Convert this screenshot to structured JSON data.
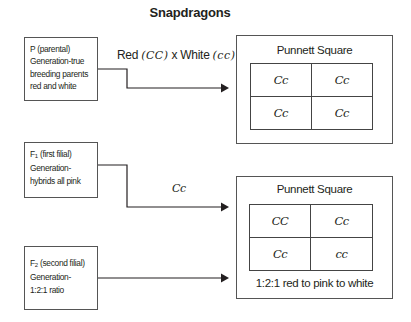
{
  "title": "Snapdragons",
  "generations": {
    "p": {
      "lines": [
        "P (parental)",
        "Generation-true",
        "breeding parents",
        "red and white"
      ]
    },
    "f1": {
      "prefix": "F",
      "subscript": "1",
      "line1_rest": " (first filial)",
      "lines": [
        "Generation-",
        "hybrids all pink"
      ]
    },
    "f2": {
      "prefix": "F",
      "subscript": "2",
      "line1_rest": " (second filial)",
      "lines": [
        "Generation-",
        "1:2:1 ratio"
      ]
    }
  },
  "cross": {
    "red_label": "Red ",
    "red_genotype": "(CC)",
    "times": " x White ",
    "white_genotype": "(cc)"
  },
  "f1_genotype": "Cc",
  "punnett1": {
    "title": "Punnett Square",
    "cells": [
      "Cc",
      "Cc",
      "Cc",
      "Cc"
    ]
  },
  "punnett2": {
    "title": "Punnett Square",
    "cells": [
      "CC",
      "Cc",
      "Cc",
      "cc"
    ],
    "caption": "1:2:1 red to pink to white"
  },
  "colors": {
    "line": "#231f20",
    "border": "#555555",
    "background": "#ffffff"
  }
}
